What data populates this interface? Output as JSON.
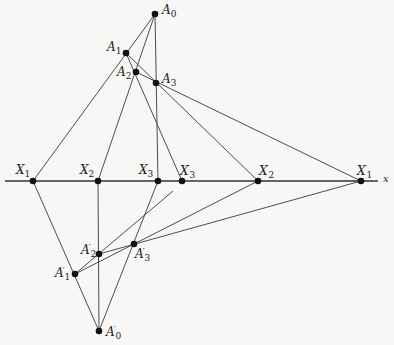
{
  "diagram": {
    "axis": {
      "label": "x",
      "y": 181,
      "x_start": 5,
      "x_end": 378,
      "color": "#333333"
    },
    "points": [
      {
        "id": "A0",
        "base": "A",
        "sub": "0",
        "prime": "",
        "x": 155,
        "y": 14
      },
      {
        "id": "A1",
        "base": "A",
        "sub": "1",
        "prime": "",
        "x": 126,
        "y": 53
      },
      {
        "id": "A2",
        "base": "A",
        "sub": "2",
        "prime": "",
        "x": 136,
        "y": 72
      },
      {
        "id": "A3",
        "base": "A",
        "sub": "3",
        "prime": "",
        "x": 156,
        "y": 83
      },
      {
        "id": "X1",
        "base": "X",
        "sub": "1",
        "prime": "",
        "x": 33,
        "y": 181
      },
      {
        "id": "X2",
        "base": "X",
        "sub": "2",
        "prime": "",
        "x": 98,
        "y": 181
      },
      {
        "id": "X3",
        "base": "X",
        "sub": "3",
        "prime": "",
        "x": 158,
        "y": 181
      },
      {
        "id": "X3p",
        "base": "X",
        "sub": "3",
        "prime": "′",
        "x": 182,
        "y": 181
      },
      {
        "id": "X2p",
        "base": "X",
        "sub": "2",
        "prime": "′",
        "x": 258,
        "y": 181
      },
      {
        "id": "X1p",
        "base": "X",
        "sub": "1",
        "prime": "′",
        "x": 361,
        "y": 181
      },
      {
        "id": "A2p",
        "base": "A",
        "sub": "2",
        "prime": "′",
        "x": 99,
        "y": 254
      },
      {
        "id": "A3p",
        "base": "A",
        "sub": "3",
        "prime": "′",
        "x": 134,
        "y": 244
      },
      {
        "id": "A1p",
        "base": "A",
        "sub": "1",
        "prime": "′",
        "x": 75,
        "y": 274
      },
      {
        "id": "A0p",
        "base": "A",
        "sub": "0",
        "prime": "′",
        "x": 99,
        "y": 331
      }
    ],
    "lines": [
      {
        "from": "A0",
        "to": "X1"
      },
      {
        "from": "A0",
        "to": "X2"
      },
      {
        "from": "A0",
        "to": "X3"
      },
      {
        "from": "A1",
        "to": "X3p"
      },
      {
        "from": "A1",
        "to": "X2p"
      },
      {
        "from": "A2",
        "to": "X1p"
      },
      {
        "from": "A0p",
        "to": "X1"
      },
      {
        "from": "A0p",
        "to": "X2"
      },
      {
        "from": "A0p",
        "to": "X3"
      },
      {
        "from": "A1p",
        "to": "X2p"
      },
      {
        "from": "A2p",
        "to": "X1p"
      },
      {
        "from": "A1p",
        "to_xy": [
          173,
          191
        ]
      }
    ],
    "labels": [
      {
        "id": "A0",
        "x": 162,
        "y": 4
      },
      {
        "id": "A1",
        "x": 107,
        "y": 41
      },
      {
        "id": "A2",
        "x": 117,
        "y": 66
      },
      {
        "id": "A3",
        "x": 162,
        "y": 73
      },
      {
        "id": "X1",
        "x": 16,
        "y": 164
      },
      {
        "id": "X2",
        "x": 80,
        "y": 164
      },
      {
        "id": "X3",
        "x": 139,
        "y": 164
      },
      {
        "id": "X3p",
        "x": 180,
        "y": 164
      },
      {
        "id": "X2p",
        "x": 259,
        "y": 164
      },
      {
        "id": "X1p",
        "x": 357,
        "y": 164
      },
      {
        "id": "A2p",
        "x": 81,
        "y": 243
      },
      {
        "id": "A3p",
        "x": 135,
        "y": 247
      },
      {
        "id": "A1p",
        "x": 55,
        "y": 266
      },
      {
        "id": "A0p",
        "x": 106,
        "y": 325
      }
    ]
  }
}
